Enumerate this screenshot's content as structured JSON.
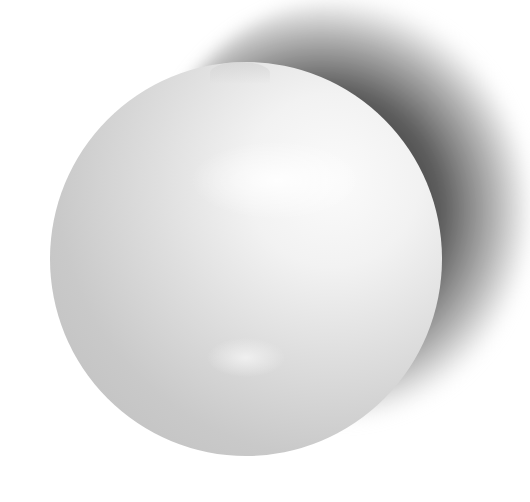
{
  "image": {
    "description": "Grayscale photograph of a white glossy sphere with a soft shadow cast toward the upper right",
    "subject": "white sphere",
    "background_color": "#ffffff",
    "colors": {
      "sphere_highlight": "#fbfbfb",
      "sphere_midtone": "#dedede",
      "sphere_edge": "#bdbdbd",
      "shadow": "#3c3c3c"
    }
  }
}
